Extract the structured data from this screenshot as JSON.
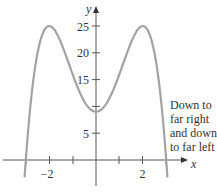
{
  "chart_data": {
    "type": "line",
    "title": "",
    "function": "f(x) = -x^4 + 8x^2 + 9",
    "xlabel": "x",
    "ylabel": "y",
    "xlim": [
      -3.9,
      3.8
    ],
    "ylim": [
      -4,
      30
    ],
    "x_ticks": [
      -3,
      -2,
      -1,
      1,
      2,
      3
    ],
    "x_tick_labels": [
      "-2",
      "2"
    ],
    "y_ticks": [
      5,
      10,
      15,
      20,
      25
    ],
    "y_tick_labels": [
      "5",
      "15",
      "20",
      "25"
    ],
    "grid": false,
    "series": [
      {
        "name": "f(x)",
        "color": "#a0a0a0",
        "x": [
          -3.2,
          -3,
          -2.5,
          -2,
          -1.5,
          -1,
          -0.5,
          0,
          0.5,
          1,
          1.5,
          2,
          2.5,
          3,
          3.2
        ],
        "y": [
          -4.9,
          0,
          20.94,
          25,
          21.94,
          16,
          10.94,
          9,
          10.94,
          16,
          21.94,
          25,
          20.94,
          0,
          -4.9
        ]
      }
    ],
    "key_points": {
      "local_maxima": [
        {
          "x": -2,
          "y": 25
        },
        {
          "x": 2,
          "y": 25
        }
      ],
      "local_minimum": {
        "x": 0,
        "y": 9
      },
      "x_intercepts": [
        -3,
        3
      ]
    },
    "annotations": [
      {
        "text": "Down to far right and down to far left",
        "position": "right"
      }
    ]
  },
  "labels": {
    "x_axis": "x",
    "y_axis": "y",
    "y_tick_5": "5",
    "y_tick_15": "15",
    "y_tick_20": "20",
    "y_tick_25": "25",
    "x_tick_neg2": "−2",
    "x_tick_2": "2",
    "annotation_lines": [
      "Down to",
      "far right",
      "and down",
      "to far left"
    ]
  }
}
